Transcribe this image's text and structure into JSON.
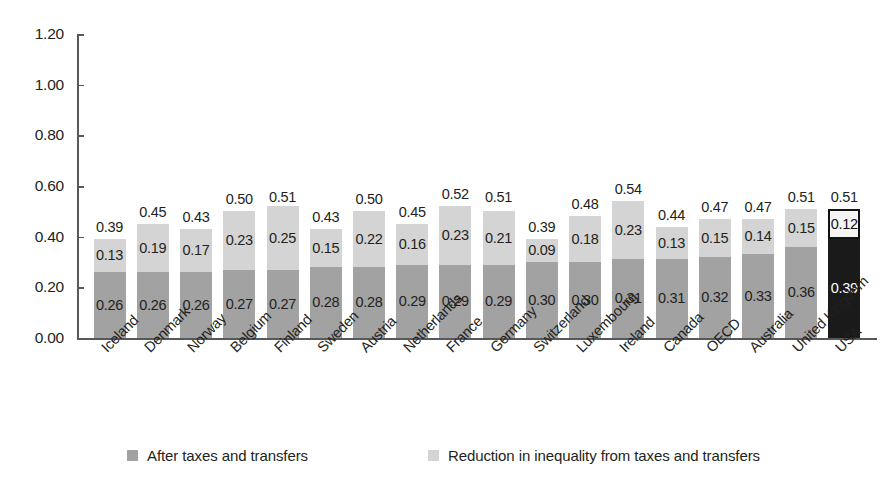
{
  "chart_data": {
    "type": "bar",
    "stacked": true,
    "title": "",
    "subtitle": "",
    "xlabel": "",
    "ylabel": "",
    "ylim": [
      0.0,
      1.2
    ],
    "ytick_values": [
      0.0,
      0.2,
      0.4,
      0.6,
      0.8,
      1.0,
      1.2
    ],
    "ytick_labels": [
      "0.00",
      "0.20",
      "0.40",
      "0.60",
      "0.80",
      "1.00",
      "1.20"
    ],
    "grid": false,
    "legend_position": "bottom",
    "categories": [
      "Iceland",
      "Denmark",
      "Norway",
      "Belgium",
      "Finland",
      "Sweden",
      "Austria",
      "Netherlands",
      "France",
      "Germany",
      "Switzerland",
      "Luxembourg",
      "Ireland",
      "Canada",
      "OECD",
      "Australia",
      "United Kingdom",
      "USA"
    ],
    "series": [
      {
        "name": "After taxes and transfers",
        "color": "#a2a2a2",
        "values": [
          0.26,
          0.26,
          0.26,
          0.27,
          0.27,
          0.28,
          0.28,
          0.29,
          0.29,
          0.29,
          0.3,
          0.3,
          0.31,
          0.31,
          0.32,
          0.33,
          0.36,
          0.39
        ],
        "labels": [
          "0.26",
          "0.26",
          "0.26",
          "0.27",
          "0.27",
          "0.28",
          "0.28",
          "0.29",
          "0.29",
          "0.29",
          "0.30",
          "0.30",
          "0.31",
          "0.31",
          "0.32",
          "0.33",
          "0.36",
          "0.39"
        ]
      },
      {
        "name": "Reduction in inequality from taxes and transfers",
        "color": "#d4d4d4",
        "values": [
          0.13,
          0.19,
          0.17,
          0.23,
          0.25,
          0.15,
          0.22,
          0.16,
          0.23,
          0.21,
          0.09,
          0.18,
          0.23,
          0.13,
          0.15,
          0.14,
          0.15,
          0.12
        ],
        "labels": [
          "0.13",
          "0.19",
          "0.17",
          "0.23",
          "0.25",
          "0.15",
          "0.22",
          "0.16",
          "0.23",
          "0.21",
          "0.09",
          "0.18",
          "0.23",
          "0.13",
          "0.15",
          "0.14",
          "0.15",
          "0.12"
        ]
      }
    ],
    "totals": [
      0.39,
      0.45,
      0.43,
      0.5,
      0.51,
      0.43,
      0.5,
      0.45,
      0.52,
      0.51,
      0.39,
      0.48,
      0.54,
      0.44,
      0.47,
      0.47,
      0.51,
      0.51
    ],
    "total_labels": [
      "0.39",
      "0.45",
      "0.43",
      "0.50",
      "0.51",
      "0.43",
      "0.50",
      "0.45",
      "0.52",
      "0.51",
      "0.39",
      "0.48",
      "0.54",
      "0.44",
      "0.47",
      "0.47",
      "0.51",
      "0.51"
    ],
    "highlight_index": 17,
    "highlight_colors": {
      "bottom": "#1a1a1a",
      "bottom_text": "#ffffff",
      "top": "#f4f4f4",
      "top_border": "#121212",
      "top_text": "#111111"
    }
  },
  "legend": {
    "items": [
      {
        "label": "After taxes and transfers",
        "color": "#a2a2a2"
      },
      {
        "label": "Reduction in inequality from taxes and transfers",
        "color": "#d4d4d4"
      }
    ]
  },
  "colors": {
    "axis": "#58585a",
    "text": "#231f20",
    "background": "#ffffff"
  }
}
